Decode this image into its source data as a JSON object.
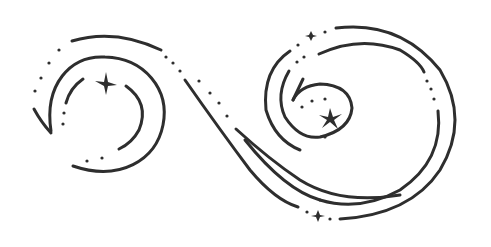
{
  "illustration": {
    "title": "Decorative swirl with sparkles",
    "ink_color": "#2e2e2e",
    "background_color": "#ffffff",
    "elements": {
      "left_spiral": "open circular swirl with inner arcs and a four-point sparkle",
      "connector": "S-shaped double line connecting left and right spirals",
      "right_spiral": "large spiral with inner curl ending in an arrow-like hook and a sparkle",
      "bottom_sparkle": "small sparkle on bottom dotted line",
      "top_sparkle": "small sparkle on top dotted line"
    }
  }
}
